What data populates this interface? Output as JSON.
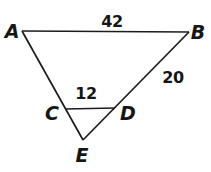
{
  "figure": {
    "kind": "geometry-triangle-diagram",
    "background_color": "#ffffff",
    "line_color": "#1c1c1c",
    "text_color": "#161616",
    "line_width": 1.7,
    "points": {
      "A": {
        "x": 22,
        "y": 31
      },
      "B": {
        "x": 189,
        "y": 32
      },
      "C": {
        "x": 65,
        "y": 109
      },
      "D": {
        "x": 115,
        "y": 108
      },
      "E": {
        "x": 83,
        "y": 140
      }
    },
    "segments": [
      {
        "name": "AB",
        "from": "A",
        "to": "B"
      },
      {
        "name": "AE",
        "from": "A",
        "to": "E"
      },
      {
        "name": "BE",
        "from": "B",
        "to": "E"
      },
      {
        "name": "CD",
        "from": "C",
        "to": "D"
      }
    ],
    "labels": {
      "A": {
        "text": "A",
        "x": 12,
        "y": 38
      },
      "B": {
        "text": "B",
        "x": 198,
        "y": 39
      },
      "C": {
        "text": "C",
        "x": 52,
        "y": 120
      },
      "D": {
        "text": "D",
        "x": 128,
        "y": 120
      },
      "E": {
        "text": "E",
        "x": 82,
        "y": 162
      },
      "AB_measure": {
        "text": "42",
        "x": 112,
        "y": 27,
        "segment": "AB"
      },
      "BD_measure": {
        "text": "20",
        "x": 173,
        "y": 83,
        "segment": "BD"
      },
      "CD_measure": {
        "text": "12",
        "x": 86,
        "y": 99,
        "segment": "CD"
      }
    }
  }
}
